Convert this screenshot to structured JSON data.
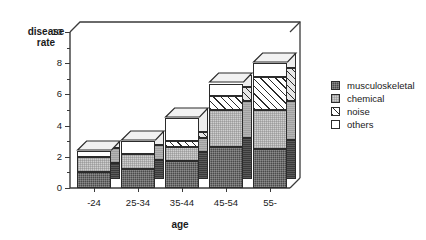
{
  "chart_data": {
    "type": "bar",
    "subtype": "stacked-bar-3d",
    "title": "",
    "xlabel": "age",
    "ylabel": "disease\nrate",
    "categories": [
      "-24",
      "25-34",
      "35-44",
      "45-54",
      "55-"
    ],
    "series": [
      {
        "name": "musculoskeletal",
        "values": [
          1.0,
          1.2,
          1.7,
          2.6,
          2.5
        ],
        "fill": "dark-checker",
        "color": "#4a4a4a"
      },
      {
        "name": "chemical",
        "values": [
          1.0,
          1.0,
          0.9,
          2.4,
          2.5
        ],
        "fill": "light-checker",
        "color": "#cfcfcf"
      },
      {
        "name": "noise",
        "values": [
          0.0,
          0.0,
          0.4,
          0.9,
          2.1
        ],
        "fill": "diagonal-hatch",
        "color": "#ffffff"
      },
      {
        "name": "others",
        "values": [
          0.4,
          0.8,
          1.5,
          0.8,
          0.9
        ],
        "fill": "solid-white",
        "color": "#ffffff"
      }
    ],
    "totals": [
      2.4,
      3.0,
      4.5,
      6.7,
      8.0
    ],
    "ylim": [
      0,
      10
    ],
    "ytick_major": [
      0,
      2,
      4,
      6,
      8,
      10
    ],
    "ytick_minor": [
      1,
      3,
      5,
      7,
      9
    ],
    "ytick_labels": [
      "0",
      "2",
      "4",
      "6",
      "8",
      "10"
    ],
    "grid": false,
    "legend_position": "right"
  },
  "legend": {
    "items": [
      {
        "label": "musculoskeletal"
      },
      {
        "label": "chemical"
      },
      {
        "label": "noise"
      },
      {
        "label": "others"
      }
    ]
  }
}
